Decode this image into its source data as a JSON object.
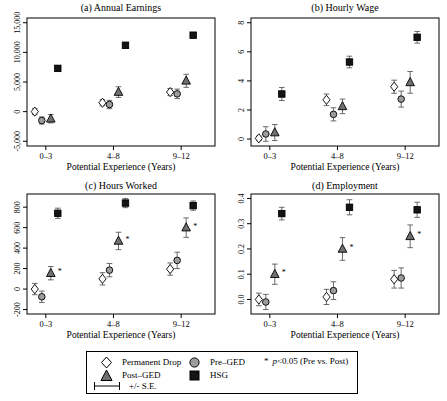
{
  "style": {
    "marker_colors": {
      "diamond": "#ffffff",
      "circle": "#9c9c9c",
      "triangle": "#6f6f6f",
      "square": "#141414"
    },
    "marker_stroke": "#000000",
    "errorbar_color": "#5a5a5a",
    "axis_color": "#000000",
    "text_color": "#000000"
  },
  "legend": {
    "items": [
      {
        "key": "permanent-drop",
        "marker": "diamond",
        "label": "Permanent Drop"
      },
      {
        "key": "pre-ged",
        "marker": "circle",
        "label": "Pre–GED"
      },
      {
        "key": "post-ged",
        "marker": "triangle",
        "label": "Post–GED"
      },
      {
        "key": "hsg",
        "marker": "square",
        "label": "HSG"
      }
    ],
    "se_label": "+/- S.E.",
    "sig_star": "*",
    "sig_p": "p",
    "sig_rest": "<0.05 (Pre vs. Post)"
  },
  "chart_data": [
    {
      "type": "scatter",
      "title": "(a) Annual Earnings",
      "xlabel": "Potential Experience (Years)",
      "categories": [
        "0–3",
        "4–8",
        "9–12"
      ],
      "ylim": [
        -5000,
        15000
      ],
      "ytick_values": [
        -5000,
        0,
        5000,
        10000,
        15000
      ],
      "ytick_labels": [
        "-5,000",
        "0",
        "5,000",
        "10,000",
        "15,000"
      ],
      "series": [
        {
          "name": "Permanent Drop",
          "marker": "diamond",
          "values": [
            0,
            1500,
            3300
          ],
          "se": [
            500,
            500,
            600
          ],
          "sig": [
            false,
            false,
            false
          ]
        },
        {
          "name": "Pre-GED",
          "marker": "circle",
          "values": [
            -1500,
            1200,
            3000
          ],
          "se": [
            600,
            700,
            800
          ],
          "sig": [
            false,
            false,
            false
          ]
        },
        {
          "name": "Post-GED",
          "marker": "triangle",
          "values": [
            -1200,
            3300,
            5200
          ],
          "se": [
            700,
            900,
            1100
          ],
          "sig": [
            false,
            false,
            false
          ]
        },
        {
          "name": "HSG",
          "marker": "square",
          "values": [
            7300,
            11200,
            12900
          ],
          "se": [
            400,
            400,
            450
          ],
          "sig": [
            false,
            false,
            false
          ]
        }
      ]
    },
    {
      "type": "scatter",
      "title": "(b) Hourly Wage",
      "xlabel": "Potential Experience (Years)",
      "categories": [
        "0–3",
        "4–8",
        "9–12"
      ],
      "ylim": [
        0,
        8
      ],
      "ytick_values": [
        0,
        2,
        4,
        6,
        8
      ],
      "ytick_labels": [
        "0",
        "2",
        "4",
        "6",
        "8"
      ],
      "series": [
        {
          "name": "Permanent Drop",
          "marker": "diamond",
          "values": [
            0.05,
            2.7,
            3.6
          ],
          "se": [
            0.15,
            0.4,
            0.45
          ],
          "sig": [
            false,
            false,
            false
          ]
        },
        {
          "name": "Pre-GED",
          "marker": "circle",
          "values": [
            0.35,
            1.7,
            2.75
          ],
          "se": [
            0.5,
            0.45,
            0.55
          ],
          "sig": [
            false,
            false,
            false
          ]
        },
        {
          "name": "Post-GED",
          "marker": "triangle",
          "values": [
            0.45,
            2.25,
            3.9
          ],
          "se": [
            0.55,
            0.5,
            0.75
          ],
          "sig": [
            false,
            false,
            false
          ]
        },
        {
          "name": "HSG",
          "marker": "square",
          "values": [
            3.1,
            5.3,
            7.0
          ],
          "se": [
            0.45,
            0.4,
            0.4
          ],
          "sig": [
            false,
            false,
            false
          ]
        }
      ]
    },
    {
      "type": "scatter",
      "title": "(c) Hours Worked",
      "xlabel": "Potential Experience (Years)",
      "categories": [
        "0–3",
        "4–8",
        "9–12"
      ],
      "ylim": [
        -200,
        800
      ],
      "ytick_values": [
        -200,
        0,
        200,
        400,
        600,
        800
      ],
      "ytick_labels": [
        "-200",
        "0",
        "200",
        "400",
        "600",
        "800"
      ],
      "series": [
        {
          "name": "Permanent Drop",
          "marker": "diamond",
          "values": [
            0,
            100,
            195
          ],
          "se": [
            55,
            60,
            60
          ],
          "sig": [
            false,
            false,
            false
          ]
        },
        {
          "name": "Pre-GED",
          "marker": "circle",
          "values": [
            -75,
            185,
            280
          ],
          "se": [
            55,
            65,
            80
          ],
          "sig": [
            false,
            false,
            false
          ]
        },
        {
          "name": "Post-GED",
          "marker": "triangle",
          "values": [
            155,
            470,
            600
          ],
          "se": [
            65,
            85,
            95
          ],
          "sig": [
            true,
            true,
            true
          ]
        },
        {
          "name": "HSG",
          "marker": "square",
          "values": [
            740,
            840,
            815
          ],
          "se": [
            50,
            45,
            45
          ],
          "sig": [
            false,
            false,
            false
          ]
        }
      ]
    },
    {
      "type": "scatter",
      "title": "(d) Employment",
      "xlabel": "Potential Experience (Years)",
      "categories": [
        "0–3",
        "4–8",
        "9–12"
      ],
      "ylim": [
        0,
        0.4
      ],
      "ytick_values": [
        0,
        0.1,
        0.2,
        0.3,
        0.4
      ],
      "ytick_labels": [
        "0.0",
        "0.1",
        "0.2",
        "0.3",
        "0.4"
      ],
      "series": [
        {
          "name": "Permanent Drop",
          "marker": "diamond",
          "values": [
            0.0,
            0.01,
            0.08
          ],
          "se": [
            0.025,
            0.03,
            0.035
          ],
          "sig": [
            false,
            false,
            false
          ]
        },
        {
          "name": "Pre-GED",
          "marker": "circle",
          "values": [
            -0.01,
            0.035,
            0.085
          ],
          "se": [
            0.03,
            0.035,
            0.04
          ],
          "sig": [
            false,
            false,
            false
          ]
        },
        {
          "name": "Post-GED",
          "marker": "triangle",
          "values": [
            0.1,
            0.2,
            0.25
          ],
          "se": [
            0.04,
            0.045,
            0.045
          ],
          "sig": [
            true,
            true,
            true
          ]
        },
        {
          "name": "HSG",
          "marker": "square",
          "values": [
            0.34,
            0.365,
            0.355
          ],
          "se": [
            0.025,
            0.03,
            0.03
          ],
          "sig": [
            false,
            false,
            false
          ]
        }
      ]
    }
  ]
}
